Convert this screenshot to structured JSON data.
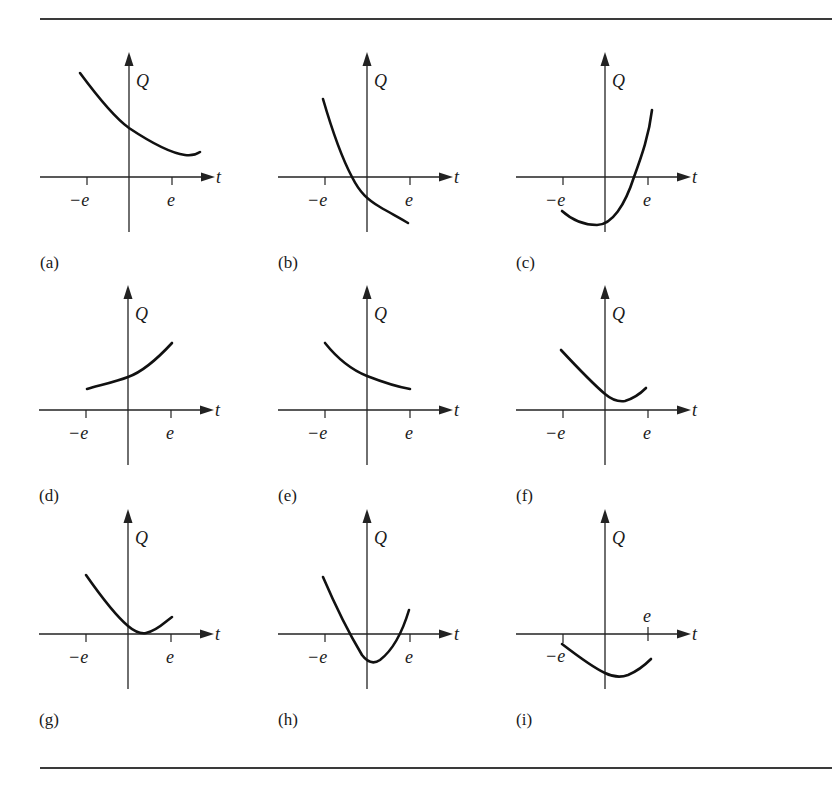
{
  "figure": {
    "axis_labels": {
      "x": "t",
      "y": "Q"
    },
    "tick_labels": {
      "neg": "−e",
      "pos": "e"
    },
    "panels": [
      {
        "id": "a",
        "label": "(a)",
        "ox": 129,
        "oy": 177,
        "curve": "M80,73 C100,100 115,118 129,128 C150,142 170,153 185,155 C192,156 197,154 200,152"
      },
      {
        "id": "b",
        "label": "(b)",
        "ox": 367,
        "oy": 177,
        "curve": "M323,99 C332,130 343,160 352,177 C360,193 368,200 380,207 C392,214 400,218 408,223"
      },
      {
        "id": "c",
        "label": "(c)",
        "ox": 605,
        "oy": 177,
        "curve": "M562,211 C572,220 585,225 597,225 C612,225 625,205 634,177 C642,155 649,135 652,110"
      },
      {
        "id": "d",
        "label": "(d)",
        "ox": 128,
        "oy": 410,
        "curve": "M87,389 C105,384 118,381 128,377 C145,371 160,356 172,343"
      },
      {
        "id": "e",
        "label": "(e)",
        "ox": 367,
        "oy": 410,
        "curve": "M325,343 C337,358 352,370 367,376 C385,383 398,387 410,389"
      },
      {
        "id": "f",
        "label": "(f)",
        "ox": 605,
        "oy": 410,
        "curve": "M561,350 C575,365 592,383 605,394 C612,400 618,402 625,401 C635,398 641,393 646,388"
      },
      {
        "id": "g",
        "label": "(g)",
        "ox": 128,
        "oy": 634,
        "curve": "M86,575 C100,595 115,615 128,626 C135,632 140,634 146,633 C157,631 165,622 172,617"
      },
      {
        "id": "h",
        "label": "(h)",
        "ox": 367,
        "oy": 634,
        "curve": "M323,577 C335,605 350,635 362,655 C368,663 374,664 380,660 C393,650 403,630 409,610"
      },
      {
        "id": "i",
        "label": "(i)",
        "ox": 605,
        "oy": 634,
        "curve": "M562,644 C575,654 592,667 605,673 C613,677 620,678 628,675 C640,670 646,664 651,659",
        "tick_label_above": true
      }
    ],
    "rules": {
      "top_y": 19,
      "bottom_y": 768
    }
  },
  "chart_data": {
    "type": "line",
    "title": "",
    "xlabel": "t",
    "ylabel": "Q",
    "xticks": [
      "−e",
      "e"
    ],
    "grid": false,
    "layout": "3x3 grid of small multiples",
    "series": [
      {
        "name": "(a)",
        "shape": "decreasing, concave up, slight minimum near t≈1.3e then rising",
        "start_sign": "positive",
        "end_sign": "positive"
      },
      {
        "name": "(b)",
        "shape": "steeply decreasing, convex, crosses zero at t≈-0.35e, ends negative",
        "start_sign": "positive",
        "end_sign": "negative"
      },
      {
        "name": "(c)",
        "shape": "convex; minimum below axis near t≈-0.2e, crosses zero at t≈0.7e, rises steeply",
        "start_sign": "negative",
        "end_sign": "positive"
      },
      {
        "name": "(d)",
        "shape": "increasing, concave up, always positive",
        "start_sign": "positive",
        "end_sign": "positive"
      },
      {
        "name": "(e)",
        "shape": "decreasing, concave up, always positive",
        "start_sign": "positive",
        "end_sign": "positive"
      },
      {
        "name": "(f)",
        "shape": "decreasing to positive minimum near t≈0.3e, then increasing",
        "start_sign": "positive",
        "end_sign": "positive"
      },
      {
        "name": "(g)",
        "shape": "decreasing to minimum touching zero near t≈0.3e, then increasing",
        "start_sign": "positive",
        "end_sign": "positive"
      },
      {
        "name": "(h)",
        "shape": "convex; crosses zero twice (t≈-0.5e, t≈0.75e), minimum below axis near t≈0.15e",
        "start_sign": "positive",
        "end_sign": "positive"
      },
      {
        "name": "(i)",
        "shape": "entirely below axis; minimum near t≈0.2e",
        "start_sign": "negative",
        "end_sign": "negative"
      }
    ]
  }
}
